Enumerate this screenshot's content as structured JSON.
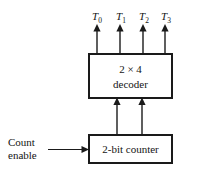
{
  "diagram": {
    "background_color": "#ffffff",
    "line_color": "#1a1a1a",
    "decoder_block": {
      "line1": "2 × 4",
      "line2": "decoder"
    },
    "counter_block": {
      "label": "2-bit counter"
    },
    "input_label": {
      "line1": "Count",
      "line2": "enable"
    },
    "outputs": [
      {
        "base": "T",
        "sub": "0"
      },
      {
        "base": "T",
        "sub": "1"
      },
      {
        "base": "T",
        "sub": "2"
      },
      {
        "base": "T",
        "sub": "3"
      }
    ],
    "connections": {
      "counter_to_decoder_lines": 2,
      "decoder_output_lines": 4,
      "enable_input_lines": 1
    }
  }
}
